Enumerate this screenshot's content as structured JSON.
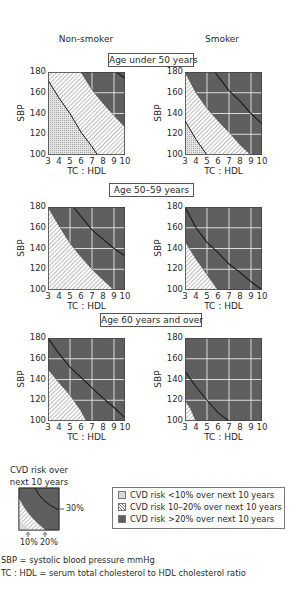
{
  "column_titles": {
    "left": "Non-smoker",
    "right": "Smoker"
  },
  "age_groups": [
    {
      "label": "Age under 50 years"
    },
    {
      "label": "Age 50–59 years"
    },
    {
      "label": "Age 60 years and over"
    }
  ],
  "axes": {
    "xlabel": "TC : HDL",
    "ylabel": "SBP",
    "xticks": [
      "3",
      "4",
      "5",
      "6",
      "7",
      "8",
      "9",
      "10"
    ],
    "yticks": [
      "180",
      "160",
      "140",
      "120",
      "100"
    ]
  },
  "colors": {
    "low": "#d8d8d8",
    "mid": "#ffffff",
    "high": "#5f5f5f",
    "grid": "#e8e8e8",
    "curve": "#1a1a1a"
  },
  "chart_data": [
    {
      "type": "area",
      "title": "Non-smoker, Age under 50 years",
      "xlabel": "TC : HDL",
      "ylabel": "SBP",
      "xlim": [
        3,
        10
      ],
      "ylim": [
        100,
        180
      ],
      "series": [
        {
          "name": "10%",
          "points": [
            [
              3,
              172
            ],
            [
              4,
              155
            ],
            [
              5,
              140
            ],
            [
              6,
              122
            ],
            [
              7,
              108
            ],
            [
              7.5,
              100
            ]
          ]
        },
        {
          "name": "20%",
          "points": [
            [
              6,
              180
            ],
            [
              7,
              163
            ],
            [
              8,
              150
            ],
            [
              9,
              138
            ],
            [
              10,
              127
            ]
          ]
        },
        {
          "name": "30%",
          "points": [
            [
              9.2,
              180
            ],
            [
              10,
              174
            ]
          ]
        }
      ]
    },
    {
      "type": "area",
      "title": "Smoker, Age under 50 years",
      "xlabel": "TC : HDL",
      "ylabel": "SBP",
      "xlim": [
        3,
        10
      ],
      "ylim": [
        100,
        180
      ],
      "series": [
        {
          "name": "10%",
          "points": [
            [
              3,
              133
            ],
            [
              4,
              115
            ],
            [
              5,
              100
            ]
          ]
        },
        {
          "name": "20%",
          "points": [
            [
              3,
              180
            ],
            [
              4,
              160
            ],
            [
              5,
              145
            ],
            [
              6,
              133
            ],
            [
              7,
              122
            ],
            [
              8,
              110
            ],
            [
              9,
              100
            ]
          ]
        },
        {
          "name": "30%",
          "points": [
            [
              5.7,
              180
            ],
            [
              7,
              162
            ],
            [
              8,
              152
            ],
            [
              9,
              140
            ],
            [
              10,
              130
            ]
          ]
        }
      ]
    },
    {
      "type": "area",
      "title": "Non-smoker, Age 50–59 years",
      "xlabel": "TC : HDL",
      "ylabel": "SBP",
      "xlim": [
        3,
        10
      ],
      "ylim": [
        100,
        180
      ],
      "series": [
        {
          "name": "20%",
          "points": [
            [
              3,
              180
            ],
            [
              4,
              162
            ],
            [
              5,
              145
            ],
            [
              6,
              132
            ],
            [
              7,
              120
            ],
            [
              8,
              110
            ],
            [
              9,
              100
            ]
          ]
        },
        {
          "name": "30%",
          "points": [
            [
              5.3,
              180
            ],
            [
              7,
              158
            ],
            [
              8,
              149
            ],
            [
              9,
              140
            ],
            [
              10,
              133
            ]
          ]
        }
      ]
    },
    {
      "type": "area",
      "title": "Smoker, Age 50–59 years",
      "xlabel": "TC : HDL",
      "ylabel": "SBP",
      "xlim": [
        3,
        10
      ],
      "ylim": [
        100,
        180
      ],
      "series": [
        {
          "name": "20%",
          "points": [
            [
              3,
              147
            ],
            [
              4,
              130
            ],
            [
              5,
              115
            ],
            [
              6,
              100
            ]
          ]
        },
        {
          "name": "30%",
          "points": [
            [
              3,
              180
            ],
            [
              4,
              160
            ],
            [
              5,
              146
            ],
            [
              6,
              136
            ],
            [
              7,
              125
            ],
            [
              8,
              117
            ],
            [
              9,
              108
            ],
            [
              10,
              100
            ]
          ]
        }
      ]
    },
    {
      "type": "area",
      "title": "Non-smoker, Age 60 years and over",
      "xlabel": "TC : HDL",
      "ylabel": "SBP",
      "xlim": [
        3,
        10
      ],
      "ylim": [
        100,
        180
      ],
      "series": [
        {
          "name": "20%",
          "points": [
            [
              3,
              150
            ],
            [
              4,
              137
            ],
            [
              5,
              125
            ],
            [
              6,
              110
            ],
            [
              6.5,
              100
            ]
          ]
        },
        {
          "name": "30%",
          "points": [
            [
              3,
              180
            ],
            [
              4,
              165
            ],
            [
              5,
              152
            ],
            [
              6,
              142
            ],
            [
              7,
              132
            ],
            [
              8,
              122
            ],
            [
              9,
              113
            ],
            [
              10,
              103
            ]
          ]
        }
      ]
    },
    {
      "type": "area",
      "title": "Smoker, Age 60 years and over",
      "xlabel": "TC : HDL",
      "ylabel": "SBP",
      "xlim": [
        3,
        10
      ],
      "ylim": [
        100,
        180
      ],
      "series": [
        {
          "name": "20%",
          "points": [
            [
              3,
              120
            ],
            [
              3.5,
              112
            ],
            [
              4,
              100
            ]
          ]
        },
        {
          "name": "30%",
          "points": [
            [
              3,
              148
            ],
            [
              4,
              133
            ],
            [
              5,
              120
            ],
            [
              6,
              108
            ],
            [
              7,
              100
            ]
          ]
        }
      ]
    }
  ],
  "key": {
    "title_line1": "CVD risk over",
    "title_line2": "next 10 years",
    "label_30": "30%",
    "label_10": "10%",
    "label_20": "20%"
  },
  "legend": [
    {
      "label": "CVD risk <10% over next 10 years",
      "swatch": "low"
    },
    {
      "label": "CVD risk 10–20% over next 10 years",
      "swatch": "mid"
    },
    {
      "label": "CVD risk >20% over next 10 years",
      "swatch": "high"
    }
  ],
  "footnotes": [
    "SBP = systolic blood pressure mmHg",
    "TC : HDL = serum total cholesterol to HDL cholesterol ratio"
  ]
}
